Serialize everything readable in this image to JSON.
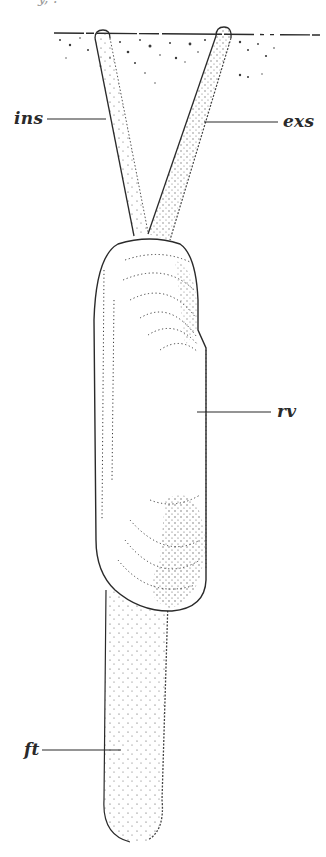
{
  "figure": {
    "top_fragment": "y, .",
    "labels": {
      "inhalant_siphon": "ins",
      "exhalant_siphon": "exs",
      "right_valve": "rv",
      "foot": "ft"
    },
    "colors": {
      "ink": "#2a2a2a",
      "stipple": "#3a3a3a",
      "background": "#ffffff"
    }
  }
}
